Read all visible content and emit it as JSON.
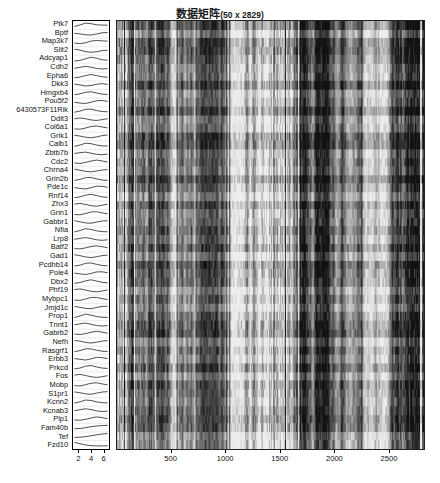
{
  "figure": {
    "title_text": "数据矩阵",
    "title_dims": "(50 x 2829)",
    "background_color": "#ffffff",
    "n_rows": 50,
    "n_cols": 2829
  },
  "row_labels": [
    "Ptk7",
    "Bptf",
    "Map3k7",
    "Slit2",
    "Adcyap1",
    "Cdh2",
    "Epha6",
    "Dkk3",
    "Hmgxb4",
    "Pou5f2",
    "6430573F11Rik",
    "Ddit3",
    "Col6a1",
    "Grik1",
    "Calb1",
    "Zbtb7b",
    "Cdc2",
    "Chrna4",
    "Grin2b",
    "Pde1c",
    "Rnf14",
    "Zhx3",
    "Grin1",
    "Gabbr1",
    "Nfia",
    "Lrp8",
    "Batf2",
    "Gad1",
    "Pcdhb14",
    "Pole4",
    "Dbx2",
    "Phf19",
    "Mybpc1",
    "Jmjd1c",
    "Prop1",
    "Tnnt1",
    "Gabrb2",
    "Nefh",
    "Rasgrf1",
    "Erbb3",
    "Prkcd",
    "Fos",
    "Mobp",
    "S1pr1",
    "Kcnn2",
    "Kcnab3",
    "Plp1",
    "Fam40b",
    "Tef",
    "Fzd10"
  ],
  "spark_panel": {
    "name": "row-profile-sparklines",
    "axis_ticks": [
      2,
      4,
      6
    ],
    "axis_tick_labels": [
      "2",
      "4",
      "6"
    ],
    "x_min": 1,
    "x_max": 7,
    "line_color": "#111111",
    "background_color": "#fdfdfd"
  },
  "heatmap": {
    "name": "data-matrix-heatmap",
    "axis_ticks": [
      500,
      1000,
      1500,
      2000,
      2500
    ],
    "axis_tick_labels": [
      "500",
      "1000",
      "1500",
      "2000",
      "2500"
    ],
    "x_min": 1,
    "x_max": 2829,
    "colormap": "gray",
    "color_low": "#0d0d0d",
    "color_high": "#f2f2f2",
    "border_color": "#222222"
  },
  "chart_data": {
    "type": "heatmap",
    "xlabel": "",
    "ylabel": "",
    "xlim": [
      1,
      2829
    ],
    "ylim": [
      1,
      50
    ],
    "grid": false,
    "legend": "none",
    "colormap": "gray",
    "n_rows": 50,
    "n_cols": 2829,
    "row_labels": [
      "Ptk7",
      "Bptf",
      "Map3k7",
      "Slit2",
      "Adcyap1",
      "Cdh2",
      "Epha6",
      "Dkk3",
      "Hmgxb4",
      "Pou5f2",
      "6430573F11Rik",
      "Ddit3",
      "Col6a1",
      "Grik1",
      "Calb1",
      "Zbtb7b",
      "Cdc2",
      "Chrna4",
      "Grin2b",
      "Pde1c",
      "Rnf14",
      "Zhx3",
      "Grin1",
      "Gabbr1",
      "Nfia",
      "Lrp8",
      "Batf2",
      "Gad1",
      "Pcdhb14",
      "Pole4",
      "Dbx2",
      "Phf19",
      "Mybpc1",
      "Jmjd1c",
      "Prop1",
      "Tnnt1",
      "Gabrb2",
      "Nefh",
      "Rasgrf1",
      "Erbb3",
      "Prkcd",
      "Fos",
      "Mobp",
      "S1pr1",
      "Kcnn2",
      "Kcnab3",
      "Plp1",
      "Fam40b",
      "Tef",
      "Fzd10"
    ],
    "x_tick_values": [
      500,
      1000,
      1500,
      2000,
      2500
    ],
    "x_tick_labels": [
      "500",
      "1000",
      "1500",
      "2000",
      "2500"
    ],
    "value_range": [
      0,
      1
    ],
    "side_panel": {
      "type": "line",
      "description": "per-row profile sparklines",
      "x_tick_values": [
        2,
        4,
        6
      ],
      "x_tick_labels": [
        "2",
        "4",
        "6"
      ],
      "xlim": [
        1,
        7
      ],
      "n_points": 7,
      "series": [
        {
          "name": "Ptk7",
          "values": [
            0.3,
            0.52,
            0.78,
            0.7,
            0.55,
            0.5,
            0.48
          ]
        },
        {
          "name": "Bptf",
          "values": [
            0.55,
            0.46,
            0.34,
            0.3,
            0.45,
            0.62,
            0.66
          ]
        },
        {
          "name": "Map3k7",
          "values": [
            0.38,
            0.3,
            0.42,
            0.66,
            0.74,
            0.7,
            0.64
          ]
        },
        {
          "name": "Slit2",
          "values": [
            0.72,
            0.6,
            0.38,
            0.28,
            0.36,
            0.52,
            0.58
          ]
        },
        {
          "name": "Adcyap1",
          "values": [
            0.26,
            0.34,
            0.58,
            0.8,
            0.66,
            0.44,
            0.36
          ]
        },
        {
          "name": "Cdh2",
          "values": [
            0.44,
            0.58,
            0.72,
            0.6,
            0.42,
            0.34,
            0.4
          ]
        },
        {
          "name": "Epha6",
          "values": [
            0.3,
            0.4,
            0.62,
            0.78,
            0.62,
            0.46,
            0.38
          ]
        },
        {
          "name": "Dkk3",
          "values": [
            0.62,
            0.5,
            0.36,
            0.42,
            0.6,
            0.7,
            0.58
          ]
        },
        {
          "name": "Hmgxb4",
          "values": [
            0.34,
            0.46,
            0.68,
            0.76,
            0.58,
            0.42,
            0.36
          ]
        },
        {
          "name": "Pou5f2",
          "values": [
            0.48,
            0.36,
            0.3,
            0.48,
            0.7,
            0.74,
            0.6
          ]
        },
        {
          "name": "6430573F11Rik",
          "values": [
            0.28,
            0.44,
            0.7,
            0.72,
            0.52,
            0.38,
            0.34
          ]
        },
        {
          "name": "Ddit3",
          "values": [
            0.56,
            0.68,
            0.58,
            0.4,
            0.32,
            0.44,
            0.58
          ]
        },
        {
          "name": "Col6a1",
          "values": [
            0.34,
            0.3,
            0.46,
            0.68,
            0.76,
            0.62,
            0.48
          ]
        },
        {
          "name": "Grik1",
          "values": [
            0.66,
            0.54,
            0.38,
            0.3,
            0.42,
            0.6,
            0.7
          ]
        },
        {
          "name": "Calb1",
          "values": [
            0.3,
            0.48,
            0.74,
            0.68,
            0.48,
            0.36,
            0.34
          ]
        },
        {
          "name": "Zbtb7b",
          "values": [
            0.5,
            0.62,
            0.7,
            0.54,
            0.38,
            0.32,
            0.42
          ]
        },
        {
          "name": "Cdc2",
          "values": [
            0.36,
            0.3,
            0.44,
            0.64,
            0.78,
            0.66,
            0.5
          ]
        },
        {
          "name": "Chrna4",
          "values": [
            0.7,
            0.56,
            0.4,
            0.32,
            0.44,
            0.58,
            0.64
          ]
        },
        {
          "name": "Grin2b",
          "values": [
            0.32,
            0.46,
            0.72,
            0.74,
            0.54,
            0.38,
            0.32
          ]
        },
        {
          "name": "Pde1c",
          "values": [
            0.52,
            0.4,
            0.32,
            0.5,
            0.72,
            0.7,
            0.56
          ]
        },
        {
          "name": "Rnf14",
          "values": [
            0.3,
            0.42,
            0.66,
            0.78,
            0.6,
            0.42,
            0.34
          ]
        },
        {
          "name": "Zhx3",
          "values": [
            0.6,
            0.7,
            0.56,
            0.38,
            0.3,
            0.44,
            0.6
          ]
        },
        {
          "name": "Grin1",
          "values": [
            0.34,
            0.3,
            0.48,
            0.7,
            0.74,
            0.58,
            0.44
          ]
        },
        {
          "name": "Gabbr1",
          "values": [
            0.68,
            0.52,
            0.36,
            0.32,
            0.48,
            0.64,
            0.68
          ]
        },
        {
          "name": "Nfia",
          "values": [
            0.3,
            0.5,
            0.76,
            0.66,
            0.46,
            0.34,
            0.32
          ]
        },
        {
          "name": "Lrp8",
          "values": [
            0.46,
            0.6,
            0.72,
            0.58,
            0.4,
            0.32,
            0.4
          ]
        },
        {
          "name": "Batf2",
          "values": [
            0.36,
            0.32,
            0.46,
            0.66,
            0.76,
            0.64,
            0.48
          ]
        },
        {
          "name": "Gad1",
          "values": [
            0.72,
            0.58,
            0.4,
            0.3,
            0.42,
            0.58,
            0.66
          ]
        },
        {
          "name": "Pcdhb14",
          "values": [
            0.32,
            0.44,
            0.7,
            0.76,
            0.56,
            0.4,
            0.34
          ]
        },
        {
          "name": "Pole4",
          "values": [
            0.54,
            0.42,
            0.32,
            0.48,
            0.7,
            0.72,
            0.58
          ]
        },
        {
          "name": "Dbx2",
          "values": [
            0.3,
            0.4,
            0.64,
            0.8,
            0.62,
            0.44,
            0.36
          ]
        },
        {
          "name": "Phf19",
          "values": [
            0.62,
            0.72,
            0.56,
            0.38,
            0.3,
            0.42,
            0.58
          ]
        },
        {
          "name": "Mybpc1",
          "values": [
            0.34,
            0.3,
            0.5,
            0.72,
            0.72,
            0.56,
            0.42
          ]
        },
        {
          "name": "Jmjd1c",
          "values": [
            0.66,
            0.54,
            0.38,
            0.34,
            0.5,
            0.66,
            0.7
          ]
        },
        {
          "name": "Prop1",
          "values": [
            0.3,
            0.52,
            0.78,
            0.64,
            0.44,
            0.34,
            0.32
          ]
        },
        {
          "name": "Tnnt1",
          "values": [
            0.48,
            0.62,
            0.74,
            0.56,
            0.38,
            0.3,
            0.38
          ]
        },
        {
          "name": "Gabrb2",
          "values": [
            0.38,
            0.32,
            0.44,
            0.64,
            0.78,
            0.66,
            0.5
          ]
        },
        {
          "name": "Nefh",
          "values": [
            0.7,
            0.6,
            0.42,
            0.32,
            0.44,
            0.6,
            0.68
          ]
        },
        {
          "name": "Rasgrf1",
          "values": [
            0.32,
            0.46,
            0.72,
            0.72,
            0.52,
            0.38,
            0.34
          ]
        },
        {
          "name": "Erbb3",
          "values": [
            0.56,
            0.44,
            0.34,
            0.5,
            0.72,
            0.68,
            0.54
          ]
        },
        {
          "name": "Prkcd",
          "values": [
            0.3,
            0.42,
            0.68,
            0.78,
            0.58,
            0.42,
            0.36
          ]
        },
        {
          "name": "Fos",
          "values": [
            0.64,
            0.74,
            0.58,
            0.4,
            0.3,
            0.4,
            0.56
          ]
        },
        {
          "name": "Mobp",
          "values": [
            0.36,
            0.3,
            0.48,
            0.7,
            0.76,
            0.6,
            0.46
          ]
        },
        {
          "name": "S1pr1",
          "values": [
            0.68,
            0.56,
            0.4,
            0.34,
            0.5,
            0.66,
            0.72
          ]
        },
        {
          "name": "Kcnn2",
          "values": [
            0.3,
            0.48,
            0.74,
            0.68,
            0.48,
            0.36,
            0.32
          ]
        },
        {
          "name": "Kcnab3",
          "values": [
            0.44,
            0.58,
            0.72,
            0.6,
            0.42,
            0.32,
            0.38
          ]
        },
        {
          "name": "Plp1",
          "values": [
            0.34,
            0.3,
            0.42,
            0.62,
            0.78,
            0.68,
            0.52
          ]
        },
        {
          "name": "Fam40b",
          "values": [
            0.3,
            0.34,
            0.46,
            0.6,
            0.7,
            0.76,
            0.8
          ]
        },
        {
          "name": "Tef",
          "values": [
            0.28,
            0.32,
            0.4,
            0.52,
            0.66,
            0.78,
            0.84
          ]
        },
        {
          "name": "Fzd10",
          "values": [
            0.8,
            0.62,
            0.44,
            0.34,
            0.3,
            0.3,
            0.32
          ]
        }
      ]
    }
  }
}
